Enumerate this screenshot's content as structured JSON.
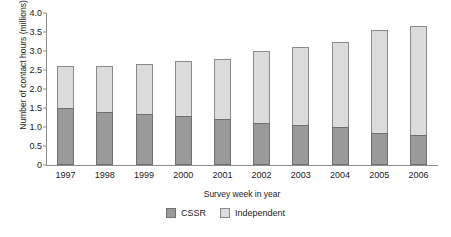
{
  "chart_data": {
    "type": "bar",
    "subtype": "stacked-vertical",
    "title": "",
    "xlabel": "Survey week in year",
    "ylabel": "Number of contact hours (millions)",
    "categories": [
      "1997",
      "1998",
      "1999",
      "2000",
      "2001",
      "2002",
      "2003",
      "2004",
      "2005",
      "2006"
    ],
    "series": [
      {
        "name": "CSSR",
        "color": "#9a9a9a",
        "values": [
          1.5,
          1.4,
          1.35,
          1.3,
          1.2,
          1.1,
          1.05,
          1.0,
          0.85,
          0.8
        ]
      },
      {
        "name": "Independent",
        "color": "#dcdcdc",
        "values": [
          1.1,
          1.2,
          1.3,
          1.45,
          1.6,
          1.9,
          2.05,
          2.25,
          2.7,
          2.85
        ]
      }
    ],
    "totals": [
      2.6,
      2.6,
      2.65,
      2.75,
      2.8,
      3.0,
      3.1,
      3.25,
      3.55,
      3.65
    ],
    "ylim": [
      0,
      4.0
    ],
    "yticks": [
      "0",
      "0.5",
      "1.0",
      "1.5",
      "2.0",
      "2.5",
      "3.0",
      "3.5",
      "4.0"
    ],
    "ytick_values": [
      0,
      0.5,
      1.0,
      1.5,
      2.0,
      2.5,
      3.0,
      3.5,
      4.0
    ],
    "grid": false,
    "legend_position": "bottom",
    "legend": [
      "CSSR",
      "Independent"
    ]
  }
}
